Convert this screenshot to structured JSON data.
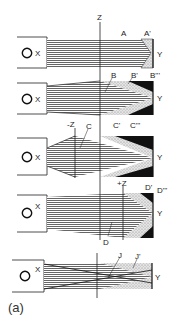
{
  "figure": {
    "caption": "(a)",
    "colors": {
      "ink": "#1a1a1a",
      "hatch": "#555555",
      "stipple": "#bdbdbd",
      "dark": "#111111",
      "background": "#ffffff"
    },
    "panels": [
      {
        "id": "p1",
        "handle_label": "X",
        "axis_label": "Z",
        "end_label": "Y",
        "labels": [
          "A",
          "A'"
        ]
      },
      {
        "id": "p2",
        "handle_label": "X",
        "end_label": "Y",
        "labels": [
          "B",
          "B'",
          "B'''"
        ]
      },
      {
        "id": "p3",
        "handle_label": "X",
        "axis_label": "-Z",
        "end_label": "Y",
        "labels": [
          "C",
          "C'",
          "C'''"
        ]
      },
      {
        "id": "p4",
        "handle_label": "X",
        "axis_label": "+Z",
        "end_label": "Y",
        "labels": [
          "D",
          "D'",
          "D'''"
        ]
      },
      {
        "id": "p5",
        "handle_label": "X",
        "end_label": "Y",
        "labels": [
          "J",
          "J'"
        ]
      }
    ]
  }
}
